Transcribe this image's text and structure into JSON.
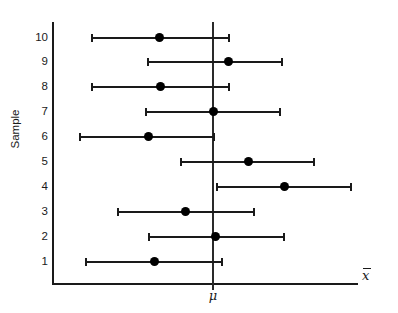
{
  "chart_data": {
    "type": "scatter",
    "title": "",
    "subtitle": "",
    "xlabel": "x̄",
    "ylabel": "Sample",
    "xlabel_plain": "x-bar",
    "reference_line": {
      "label": "μ",
      "label_plain": "mu",
      "value": 212,
      "orientation": "vertical"
    },
    "grid": false,
    "legend": null,
    "x_axis": {
      "ticks": [],
      "tick_labels": [],
      "range_px": [
        52,
        358
      ],
      "note": "unscaled axis, no numeric tick labels shown"
    },
    "y_axis": {
      "categories": [
        "1",
        "2",
        "3",
        "4",
        "5",
        "6",
        "7",
        "8",
        "9",
        "10"
      ],
      "tick_labels": [
        "10",
        "9",
        "8",
        "7",
        "6",
        "5",
        "4",
        "3",
        "2",
        "1"
      ],
      "range": [
        1,
        10
      ]
    },
    "series": [
      {
        "name": "Confidence intervals",
        "intervals": [
          {
            "sample": "10",
            "lower": 91,
            "mean": 159,
            "upper": 230,
            "contains_mu": true
          },
          {
            "sample": "9",
            "lower": 147,
            "mean": 228,
            "upper": 283,
            "contains_mu": true
          },
          {
            "sample": "8",
            "lower": 91,
            "mean": 160,
            "upper": 230,
            "contains_mu": true
          },
          {
            "sample": "7",
            "lower": 145,
            "mean": 213,
            "upper": 281,
            "contains_mu": true
          },
          {
            "sample": "6",
            "lower": 79,
            "mean": 148,
            "upper": 215,
            "contains_mu": true
          },
          {
            "sample": "5",
            "lower": 180,
            "mean": 248,
            "upper": 315,
            "contains_mu": true
          },
          {
            "sample": "4",
            "lower": 216,
            "mean": 284,
            "upper": 352,
            "contains_mu": false
          },
          {
            "sample": "3",
            "lower": 117,
            "mean": 185,
            "upper": 255,
            "contains_mu": true
          },
          {
            "sample": "2",
            "lower": 148,
            "mean": 215,
            "upper": 285,
            "contains_mu": true
          },
          {
            "sample": "1",
            "lower": 85,
            "mean": 154,
            "upper": 223,
            "contains_mu": true
          }
        ]
      }
    ],
    "rows_layout": [
      {
        "sample": "10",
        "y": 38
      },
      {
        "sample": "9",
        "y": 62
      },
      {
        "sample": "8",
        "y": 87
      },
      {
        "sample": "7",
        "y": 112
      },
      {
        "sample": "6",
        "y": 137
      },
      {
        "sample": "5",
        "y": 162
      },
      {
        "sample": "4",
        "y": 187
      },
      {
        "sample": "3",
        "y": 212
      },
      {
        "sample": "2",
        "y": 237
      },
      {
        "sample": "1",
        "y": 262
      }
    ],
    "colors": {
      "line": "#1a1a1a",
      "dot": "#000000",
      "reference": "#2a2a2a",
      "background": "#ffffff"
    }
  }
}
